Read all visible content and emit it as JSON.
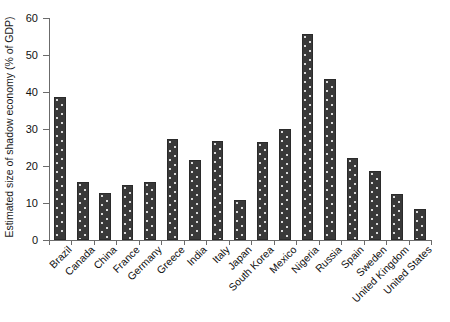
{
  "chart_data": {
    "type": "bar",
    "title": "",
    "subtitle": "",
    "xlabel": "",
    "ylabel": "Estimated size of shadow economy (% of GDP)",
    "ylim": [
      0,
      60
    ],
    "yticks": [
      0,
      10,
      20,
      30,
      40,
      50,
      60
    ],
    "ytick_labels": [
      "0",
      "10",
      "20",
      "30",
      "40",
      "50",
      "60"
    ],
    "grid": false,
    "legend": null,
    "legend_position": "none",
    "bar_fill": "#393939",
    "bar_pattern": "white-dot-hatch",
    "axis_color": "#6b6b6b",
    "background": "#ffffff",
    "categories": [
      "Brazil",
      "Canada",
      "China",
      "France",
      "Germany",
      "Greece",
      "India",
      "Italy",
      "Japan",
      "South Korea",
      "Mexico",
      "Nigeria",
      "Russia",
      "Spain",
      "Sweden",
      "United Kingdom",
      "United States"
    ],
    "values": [
      38.7,
      15.6,
      12.6,
      14.8,
      15.6,
      27.2,
      21.7,
      26.8,
      10.8,
      26.5,
      29.9,
      55.7,
      43.6,
      22.2,
      18.6,
      12.4,
      8.4
    ]
  }
}
